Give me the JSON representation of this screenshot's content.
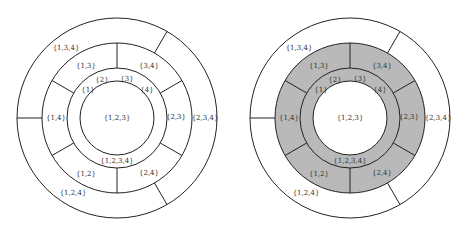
{
  "diagrams": [
    {
      "name": "left-diagram",
      "center": [
        117,
        118
      ],
      "radii": {
        "outer": 100,
        "middle": 75,
        "inner_ring": 50,
        "core": 37
      },
      "shaded": false,
      "fill_color": "#ffffff",
      "core_label": "{1,2,3}",
      "bottom_label": "{1,2,3,4}",
      "singletons": [
        "{1}",
        "{2}",
        "{3}",
        "{4}"
      ],
      "pairs": [
        "{1,3}",
        "{3,4}",
        "{2,3}",
        "{2,4}",
        "{1,2}",
        "{1,4}"
      ],
      "triples": [
        "{1,3,4}",
        "{2,3,4}",
        "{1,2,4}"
      ]
    },
    {
      "name": "right-diagram",
      "center": [
        350,
        118
      ],
      "radii": {
        "outer": 100,
        "middle": 75,
        "inner_ring": 50,
        "core": 37
      },
      "shaded": true,
      "fill_color": "#b9b9b9",
      "core_label": "{1,2,3}",
      "bottom_label": "{1,2,3,4}",
      "singletons": [
        "{1}",
        "{2}",
        "{3}",
        "{4}"
      ],
      "pairs": [
        "{1,3}",
        "{3,4}",
        "{2,3}",
        "{2,4}",
        "{1,2}",
        "{1,4}"
      ],
      "triples": [
        "{1,3,4}",
        "{2,3,4}",
        "{1,2,4}"
      ]
    }
  ],
  "colors": {
    "stroke": "#222222",
    "text": "#333333",
    "shade": "#b9b9b9",
    "background": "#ffffff"
  }
}
